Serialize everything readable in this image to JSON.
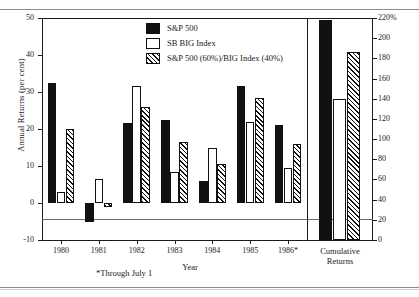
{
  "figure": {
    "scan_top_fragment": "",
    "footnote": "*Through July 1"
  },
  "legend": {
    "items": [
      {
        "label": "S&P 500",
        "style": "solid",
        "color": "#111111"
      },
      {
        "label": "SB BIG Index",
        "style": "open",
        "color": "#ffffff"
      },
      {
        "label": "S&P 500 (60%)/BIG Index (40%)",
        "style": "hatch",
        "color": "#111111"
      }
    ]
  },
  "chart_data": {
    "type": "bar",
    "title": "",
    "xlabel": "Year",
    "ylabel": "Annual Returns (per cent)",
    "y2label": "",
    "categories": [
      "1980",
      "1981",
      "1982",
      "1983",
      "1984",
      "1985",
      "1986*"
    ],
    "ylim": [
      -10,
      50
    ],
    "yticks": [
      -10,
      0,
      10,
      20,
      30,
      40,
      50
    ],
    "ytick_labels": [
      "-10",
      "0",
      "10",
      "20",
      "30",
      "40",
      "50"
    ],
    "y2lim": [
      0,
      220
    ],
    "y2ticks": [
      0,
      20,
      40,
      60,
      80,
      100,
      120,
      140,
      160,
      180,
      200,
      220
    ],
    "y2tick_labels": [
      "0",
      "20",
      "40",
      "60",
      "80",
      "100",
      "120",
      "140",
      "160",
      "180",
      "200",
      "220%"
    ],
    "grid": false,
    "legend_position": "top-center",
    "series": [
      {
        "name": "S&P 500",
        "style": "solid",
        "values": [
          32.5,
          -5.0,
          21.5,
          22.5,
          6.0,
          31.5,
          21.0
        ]
      },
      {
        "name": "SB BIG Index",
        "style": "open",
        "values": [
          3.0,
          6.5,
          31.5,
          8.5,
          15.0,
          22.0,
          9.5
        ]
      },
      {
        "name": "S&P 500 (60%)/BIG Index (40%)",
        "style": "hatch",
        "values": [
          20.0,
          -1.0,
          26.0,
          16.5,
          10.5,
          28.5,
          16.0
        ]
      }
    ],
    "cumulative_panel": {
      "label_line1": "Cumulative",
      "label_line2": "Returns",
      "unit": "per cent",
      "values": [
        {
          "name": "S&P 500",
          "style": "solid",
          "value": 218
        },
        {
          "name": "SB BIG Index",
          "style": "open",
          "value": 140
        },
        {
          "name": "S&P 500 (60%)/BIG Index (40%)",
          "style": "hatch",
          "value": 186
        }
      ]
    }
  }
}
